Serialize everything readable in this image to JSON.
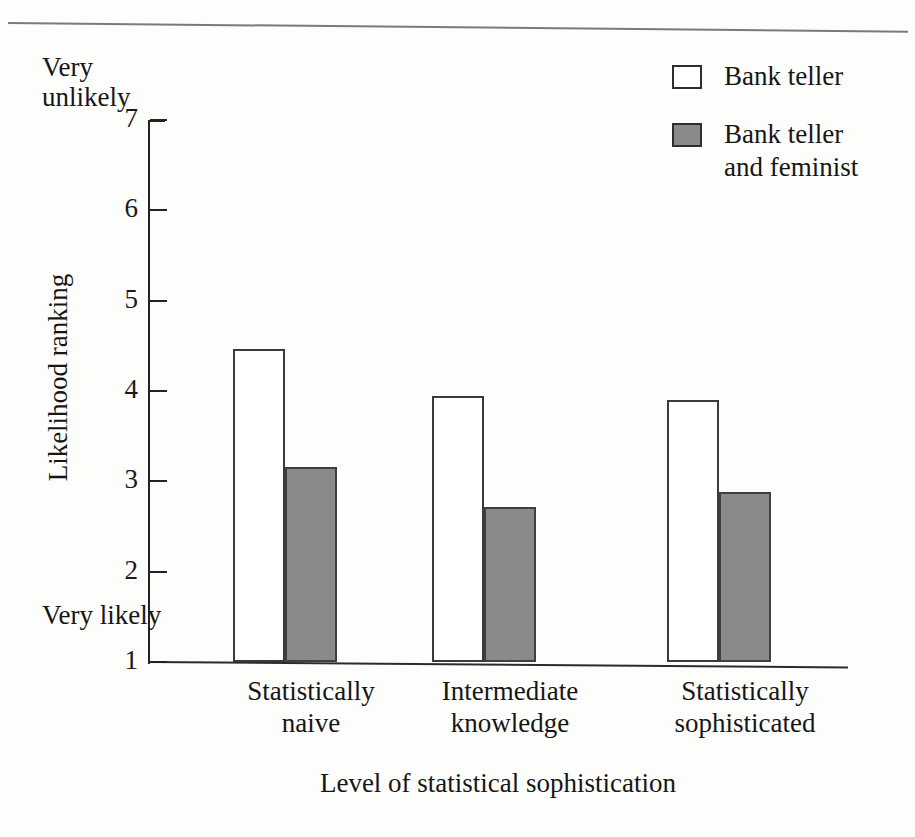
{
  "figure": {
    "top_rule_color": "#6f6f72",
    "background": "#fdfdfc"
  },
  "axis_endpoints": {
    "top_label": "Very\nunlikely",
    "bottom_label": "Very\nlikely"
  },
  "legend": {
    "items": [
      {
        "label": "Bank teller",
        "swatch": "open",
        "color": "#ffffff"
      },
      {
        "label": "Bank teller\nand feminist",
        "swatch": "filled",
        "color": "#8a8a8a"
      }
    ]
  },
  "chart_data": {
    "type": "bar",
    "title": "",
    "subtitle": "",
    "xlabel": "Level of statistical sophistication",
    "ylabel": "Likelihood ranking",
    "categories": [
      "Statistically\nnaive",
      "Intermediate\nknowledge",
      "Statistically\nsophisticated"
    ],
    "series": [
      {
        "name": "Bank teller",
        "color": "#ffffff",
        "values": [
          4.47,
          3.94,
          3.9
        ]
      },
      {
        "name": "Bank teller and feminist",
        "color": "#8a8a8a",
        "values": [
          3.16,
          2.72,
          2.88
        ]
      }
    ],
    "ylim": [
      1,
      7
    ],
    "yticks": [
      1,
      2,
      3,
      4,
      5,
      6,
      7
    ],
    "ytick_labels": [
      "1",
      "2",
      "3",
      "4",
      "5",
      "6",
      "7"
    ],
    "y_axis_low_annotation": "Very likely",
    "y_axis_high_annotation": "Very unlikely",
    "grid": false,
    "legend_position": "top-right"
  }
}
